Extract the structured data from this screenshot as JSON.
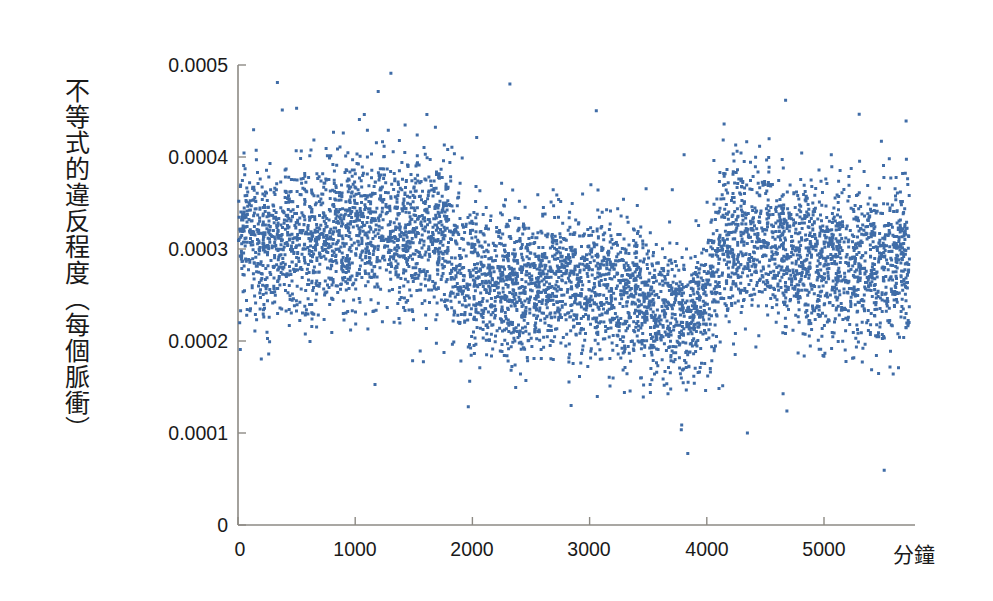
{
  "chart_data": {
    "type": "scatter",
    "title": "",
    "xlabel": "分鐘",
    "ylabel": "不等式的違反程度（每個脈衝）",
    "xlim": [
      0,
      5800
    ],
    "ylim": [
      0,
      0.0005
    ],
    "xticks": [
      0,
      1000,
      2000,
      3000,
      4000,
      5000
    ],
    "xtick_labels": [
      "0",
      "1000",
      "2000",
      "3000",
      "4000",
      "5000"
    ],
    "yticks": [
      0,
      0.0001,
      0.0002,
      0.0003,
      0.0004,
      0.0005
    ],
    "ytick_labels": [
      "0",
      "0.0001",
      "0.0002",
      "0.0003",
      "0.0004",
      "0.0005"
    ],
    "grid": false,
    "legend": null,
    "marker": {
      "shape": "square",
      "size_px": 3,
      "color": "#2f5f9f"
    },
    "n_points": 5600,
    "segments": [
      {
        "x_start": 0,
        "x_end": 1850,
        "mean": 0.000312,
        "sigma": 4.2e-05
      },
      {
        "x_start": 1850,
        "x_end": 3600,
        "mean": 0.000262,
        "sigma": 4e-05
      },
      {
        "x_start": 3600,
        "x_end": 4050,
        "mean": 0.000222,
        "sigma": 3.8e-05
      },
      {
        "x_start": 4050,
        "x_end": 4700,
        "mean": 0.000302,
        "sigma": 4.4e-05
      },
      {
        "x_start": 4700,
        "x_end": 5730,
        "mean": 0.000281,
        "sigma": 4.2e-05
      }
    ],
    "trend_points": [
      {
        "x": 0,
        "y": 0.00032
      },
      {
        "x": 300,
        "y": 0.000306
      },
      {
        "x": 600,
        "y": 0.000308
      },
      {
        "x": 900,
        "y": 0.000315
      },
      {
        "x": 1200,
        "y": 0.00032
      },
      {
        "x": 1500,
        "y": 0.000318
      },
      {
        "x": 1800,
        "y": 0.000312
      },
      {
        "x": 1900,
        "y": 0.000268
      },
      {
        "x": 2200,
        "y": 0.000264
      },
      {
        "x": 2500,
        "y": 0.000262
      },
      {
        "x": 2800,
        "y": 0.000266
      },
      {
        "x": 3100,
        "y": 0.000262
      },
      {
        "x": 3400,
        "y": 0.00025
      },
      {
        "x": 3700,
        "y": 0.000228
      },
      {
        "x": 3850,
        "y": 0.000218
      },
      {
        "x": 4000,
        "y": 0.000248
      },
      {
        "x": 4150,
        "y": 0.0003
      },
      {
        "x": 4400,
        "y": 0.000306
      },
      {
        "x": 4700,
        "y": 0.000298
      },
      {
        "x": 5000,
        "y": 0.000284
      },
      {
        "x": 5300,
        "y": 0.00028
      },
      {
        "x": 5600,
        "y": 0.000282
      },
      {
        "x": 5730,
        "y": 0.000278
      }
    ],
    "axis_color": "#8d8a84",
    "marker_color": "#2f5f9f",
    "background": "#ffffff"
  },
  "axes": {
    "x_axis_name": "x-axis",
    "y_axis_name": "y-axis"
  }
}
